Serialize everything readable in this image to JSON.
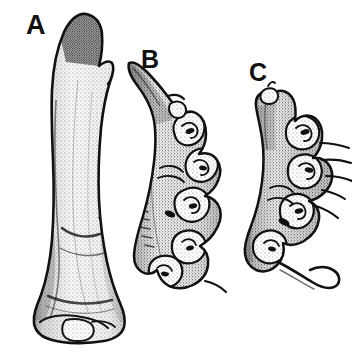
{
  "plate": {
    "background_color": "#ffffff",
    "ink_color": "#111111",
    "width": 352,
    "height": 352,
    "technique": "stippled pen-and-ink line drawing",
    "figures": [
      {
        "label": "A",
        "name": "specimen-a",
        "description": "Large elongate club-shaped specimen, smooth unbranched surface, tapering to a curved pointed apex at top and expanding to a broad rounded lobed base at bottom",
        "label_x": 26,
        "label_y": 12
      },
      {
        "label": "B",
        "name": "specimen-b",
        "description": "Medium elongate specimen with a slender pointed spur projecting to the upper left and an irregular knobby lobed lower body bearing convoluted outgrowths",
        "label_x": 141,
        "label_y": 47
      },
      {
        "label": "C",
        "name": "specimen-c",
        "description": "Smaller irregular specimen with a narrow upper stalk, a densely convoluted nodular body bearing several slender spine-like projections to the right, and a curved tail-like appendage at the base",
        "label_x": 249,
        "label_y": 60
      }
    ]
  }
}
